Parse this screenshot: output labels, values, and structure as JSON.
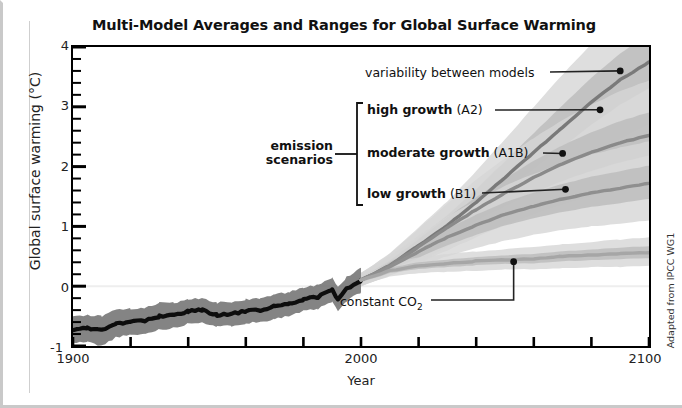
{
  "figure": {
    "title": "Multi-Model Averages and Ranges for Global Surface Warming",
    "ylabel": "Global surface warming (°C)",
    "xlabel": "Year",
    "credit": "Adapted from IPCC WG1",
    "group_label_line1": "emission",
    "group_label_line2": "scenarios"
  },
  "annotations": {
    "variability": "variability between models",
    "high_bold": "high growth",
    "high_code": " (A2)",
    "moderate_bold": "moderate growth",
    "moderate_code": " (A1B)",
    "low_bold": "low growth",
    "low_code": " (B1)",
    "constant_co2": "constant CO",
    "constant_co2_sub": "2"
  },
  "colors": {
    "axis": "#000000",
    "historical_line": "#0d0d0d",
    "historical_band": "#6e6e6e",
    "a2_line": "#7a7a7a",
    "a1b_line": "#8a8a8a",
    "b1_line": "#8f8f8f",
    "commit_line": "#a6a6a6",
    "band_light": "#d6d6d6",
    "band_mid": "#bdbdbd",
    "zero_gridline": "#eeeeee",
    "frame": "#c9c9c9",
    "text": "#111111"
  },
  "chart_data": {
    "type": "line",
    "title": "Multi-Model Averages and Ranges for Global Surface Warming",
    "xlabel": "Year",
    "ylabel": "Global surface warming (°C)",
    "xlim": [
      1900,
      2100
    ],
    "ylim": [
      -1,
      4
    ],
    "xticks": [
      1900,
      1920,
      1940,
      1960,
      1980,
      2000,
      2020,
      2040,
      2060,
      2080,
      2100
    ],
    "xtick_labels_shown": [
      "1900",
      "2000",
      "2100"
    ],
    "yticks": [
      -1,
      0,
      1,
      2,
      3,
      4
    ],
    "ytick_minor_step": 0.2,
    "grid": false,
    "zero_gridline": true,
    "legend": "inline-annotations",
    "series": [
      {
        "name": "20th century (historical)",
        "label": "20th century",
        "color": "#0d0d0d",
        "band_color": "#6e6e6e",
        "x": [
          1900,
          1905,
          1910,
          1915,
          1920,
          1925,
          1930,
          1935,
          1940,
          1945,
          1950,
          1955,
          1960,
          1965,
          1970,
          1975,
          1980,
          1985,
          1990,
          1992,
          1995,
          2000
        ],
        "values": [
          -0.72,
          -0.7,
          -0.74,
          -0.62,
          -0.6,
          -0.58,
          -0.5,
          -0.49,
          -0.42,
          -0.4,
          -0.48,
          -0.46,
          -0.42,
          -0.4,
          -0.34,
          -0.3,
          -0.22,
          -0.18,
          -0.06,
          -0.22,
          -0.05,
          0.1
        ],
        "band_lower": [
          -0.95,
          -0.93,
          -1.0,
          -0.85,
          -0.82,
          -0.8,
          -0.72,
          -0.7,
          -0.62,
          -0.6,
          -0.68,
          -0.66,
          -0.62,
          -0.6,
          -0.54,
          -0.5,
          -0.42,
          -0.38,
          -0.26,
          -0.42,
          -0.25,
          -0.1
        ],
        "band_upper": [
          -0.5,
          -0.48,
          -0.5,
          -0.4,
          -0.38,
          -0.36,
          -0.28,
          -0.28,
          -0.22,
          -0.2,
          -0.28,
          -0.26,
          -0.22,
          -0.2,
          -0.14,
          -0.1,
          -0.02,
          0.02,
          0.14,
          -0.02,
          0.15,
          0.3
        ]
      },
      {
        "name": "A2 (high growth)",
        "label": "high growth (A2)",
        "color": "#7a7a7a",
        "x": [
          2000,
          2010,
          2020,
          2030,
          2040,
          2050,
          2060,
          2070,
          2080,
          2090,
          2100
        ],
        "values": [
          0.1,
          0.35,
          0.68,
          1.02,
          1.4,
          1.82,
          2.24,
          2.66,
          3.08,
          3.45,
          3.75
        ],
        "band_lower": [
          0.0,
          0.18,
          0.4,
          0.66,
          0.94,
          1.24,
          1.56,
          1.88,
          2.18,
          2.46,
          2.7
        ],
        "band_upper": [
          0.22,
          0.55,
          0.98,
          1.42,
          1.92,
          2.46,
          3.0,
          3.54,
          4.05,
          4.5,
          4.9
        ]
      },
      {
        "name": "A1B (moderate growth)",
        "label": "moderate growth (A1B)",
        "color": "#8a8a8a",
        "x": [
          2000,
          2010,
          2020,
          2030,
          2040,
          2050,
          2060,
          2070,
          2080,
          2090,
          2100
        ],
        "values": [
          0.1,
          0.34,
          0.66,
          0.98,
          1.28,
          1.56,
          1.82,
          2.05,
          2.24,
          2.4,
          2.52
        ],
        "band_lower": [
          0.0,
          0.18,
          0.38,
          0.6,
          0.82,
          1.02,
          1.2,
          1.36,
          1.5,
          1.62,
          1.72
        ],
        "band_upper": [
          0.22,
          0.54,
          0.96,
          1.38,
          1.78,
          2.14,
          2.48,
          2.78,
          3.04,
          3.26,
          3.44
        ]
      },
      {
        "name": "B1 (low growth)",
        "label": "low growth (B1)",
        "color": "#8f8f8f",
        "x": [
          2000,
          2010,
          2020,
          2030,
          2040,
          2050,
          2060,
          2070,
          2080,
          2090,
          2100
        ],
        "values": [
          0.1,
          0.32,
          0.58,
          0.82,
          1.02,
          1.2,
          1.34,
          1.46,
          1.56,
          1.64,
          1.72
        ],
        "band_lower": [
          0.0,
          0.18,
          0.34,
          0.5,
          0.64,
          0.76,
          0.86,
          0.94,
          1.0,
          1.05,
          1.1
        ],
        "band_upper": [
          0.22,
          0.5,
          0.84,
          1.16,
          1.44,
          1.68,
          1.88,
          2.06,
          2.2,
          2.32,
          2.42
        ]
      },
      {
        "name": "Year 2000 constant concentrations",
        "label": "constant CO2",
        "color": "#a6a6a6",
        "x": [
          2000,
          2010,
          2020,
          2030,
          2040,
          2050,
          2060,
          2070,
          2080,
          2090,
          2100
        ],
        "values": [
          0.1,
          0.26,
          0.34,
          0.38,
          0.42,
          0.44,
          0.46,
          0.5,
          0.52,
          0.54,
          0.56
        ],
        "band_lower": [
          0.02,
          0.16,
          0.22,
          0.24,
          0.26,
          0.28,
          0.28,
          0.3,
          0.32,
          0.32,
          0.34
        ],
        "band_upper": [
          0.18,
          0.38,
          0.48,
          0.54,
          0.58,
          0.62,
          0.66,
          0.7,
          0.74,
          0.78,
          0.82
        ]
      }
    ],
    "callouts": [
      {
        "label": "variability between models",
        "x": 2090,
        "y": 3.6
      },
      {
        "label": "high growth (A2)",
        "x": 2083,
        "y": 2.95
      },
      {
        "label": "moderate growth (A1B)",
        "x": 2070,
        "y": 2.22
      },
      {
        "label": "low growth (B1)",
        "x": 2071,
        "y": 1.62
      },
      {
        "label": "constant CO2",
        "x": 2053,
        "y": 0.41
      }
    ]
  }
}
